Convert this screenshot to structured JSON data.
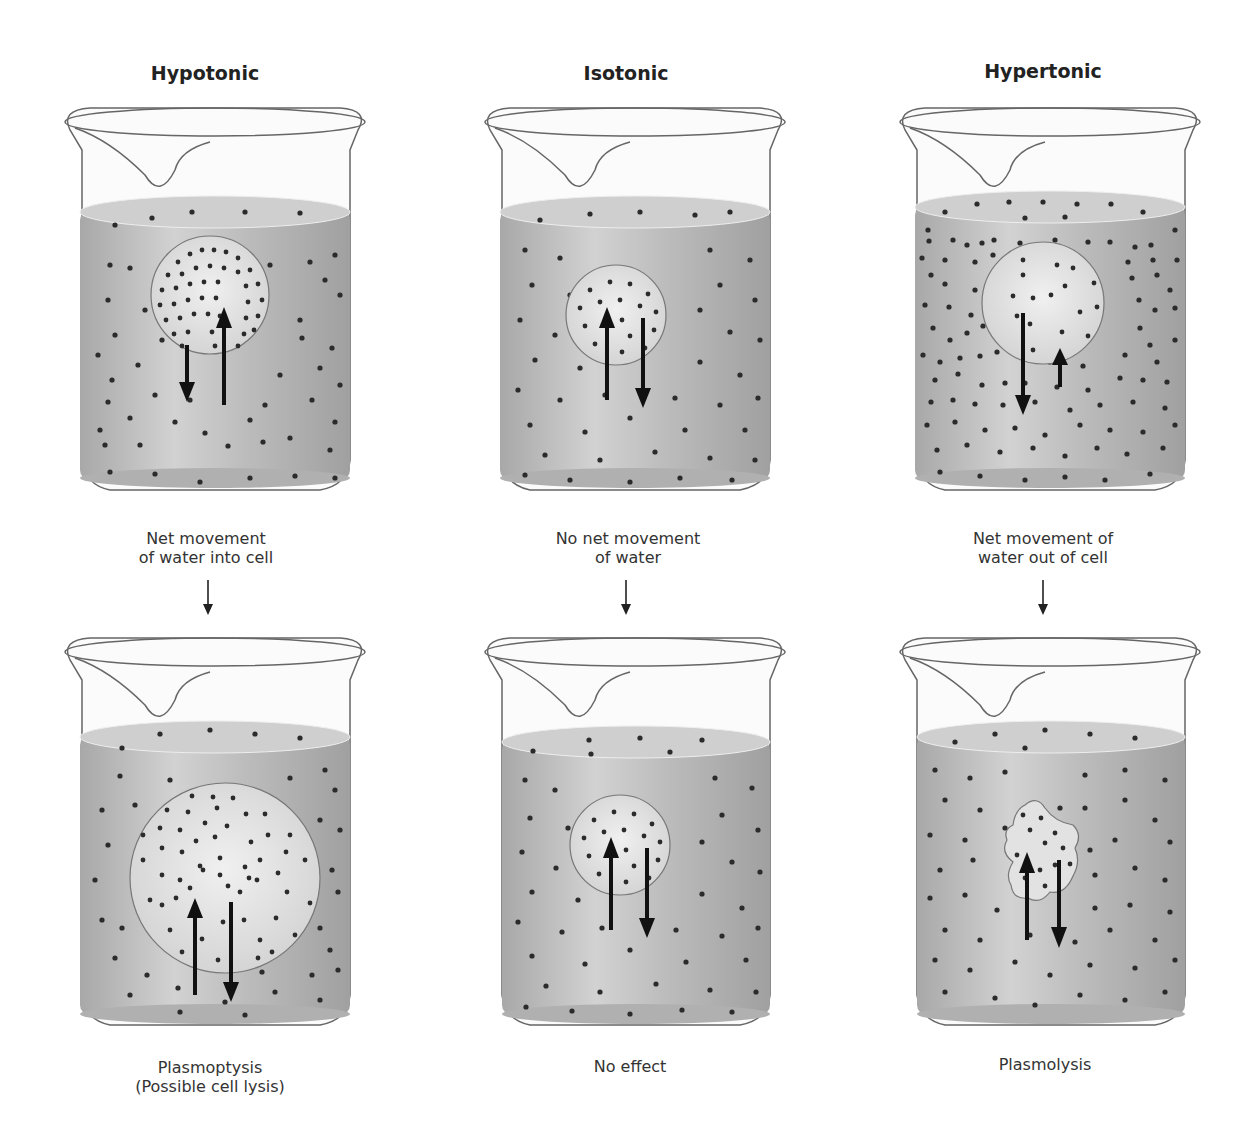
{
  "columns": [
    {
      "id": "hypotonic",
      "title": "Hypotonic",
      "transition_caption_line1": "Net movement",
      "transition_caption_line2": "of water into cell",
      "result_caption_line1": "Plasmoptysis",
      "result_caption_line2": "(Possible cell lysis)"
    },
    {
      "id": "isotonic",
      "title": "Isotonic",
      "transition_caption_line1": "No net movement",
      "transition_caption_line2": "of water",
      "result_caption_line1": "No effect",
      "result_caption_line2": ""
    },
    {
      "id": "hypertonic",
      "title": "Hypertonic",
      "transition_caption_line1": "Net movement of",
      "transition_caption_line2": "water out of cell",
      "result_caption_line1": "Plasmolysis",
      "result_caption_line2": ""
    }
  ],
  "colors": {
    "liquid": "#b9b9b9",
    "liquid_top": "#cfcfcf",
    "cell": "#e4e4e4",
    "solute": "#2b2b2b",
    "outline": "#555555"
  }
}
